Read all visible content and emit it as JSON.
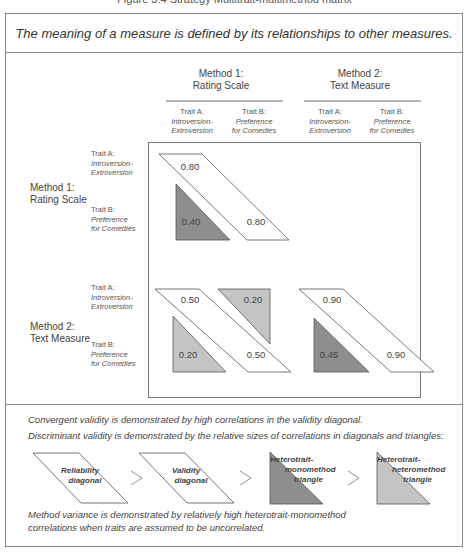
{
  "figure_caption": "Figure 3.4 Strategy Multitrait-multimethod matrix",
  "headline": "The meaning of a measure is defined by its relationships to other measures.",
  "columns": {
    "methods": [
      {
        "line1": "Method 1:",
        "line2": "Rating Scale"
      },
      {
        "line1": "Method 2:",
        "line2": "Text Measure"
      }
    ],
    "traits": [
      {
        "label": "Trait A:",
        "name1": "Introversion-",
        "name2": "Extroversion"
      },
      {
        "label": "Trait B:",
        "name1": "Preference",
        "name2": "for Comedies"
      },
      {
        "label": "Trait A:",
        "name1": "Introversion-",
        "name2": "Extroversion"
      },
      {
        "label": "Trait B:",
        "name1": "Preference",
        "name2": "for Comedies"
      }
    ]
  },
  "rows": {
    "methods": [
      {
        "line1": "Method 1:",
        "line2": "Rating Scale"
      },
      {
        "line1": "Method 2:",
        "line2": "Text Measure"
      }
    ],
    "traits": [
      {
        "label": "Trait A:",
        "name1": "Introversion-",
        "name2": "Extroversion"
      },
      {
        "label": "Trait B:",
        "name1": "Preference",
        "name2": "for Comedies"
      },
      {
        "label": "Trait A:",
        "name1": "Introversion-",
        "name2": "Extroversion"
      },
      {
        "label": "Trait B:",
        "name1": "Preference",
        "name2": "for Comedies"
      }
    ]
  },
  "matrix": {
    "m1_reliability": [
      "0.80",
      "0.80"
    ],
    "m1_hetero_mono": "0.40",
    "validity_diagonal": [
      "0.50",
      "0.50"
    ],
    "hetero_hetero": [
      "0.20",
      "0.20"
    ],
    "m2_reliability": [
      "0.90",
      "0.90"
    ],
    "m2_hetero_mono": "0.45"
  },
  "colors": {
    "dark_triangle": "#8e8e8e",
    "light_triangle": "#c4c4c4",
    "outline": "#555555",
    "frame": "#888888"
  },
  "explanation": {
    "convergent": "Convergent validity is demonstrated by high correlations in the validity diagonal.",
    "discriminant": "Discriminant validity is demonstrated by the relative sizes of correlations in diagonals and triangles:",
    "legend": [
      {
        "line1": "Reliability",
        "line2": "diagonal"
      },
      {
        "line1": "Validity",
        "line2": "diagonal"
      },
      {
        "line1": "Heterotrait-",
        "line2": "monomethod",
        "line3": "triangle"
      },
      {
        "line1": "Heterotrait-",
        "line2": "heteromethod",
        "line3": "triangle"
      }
    ],
    "comparator": ">",
    "method_variance_1": "Method variance is demonstrated by relatively high heterotrait-monomethod",
    "method_variance_2": "correlations when traits are assumed to be uncorrelated."
  }
}
